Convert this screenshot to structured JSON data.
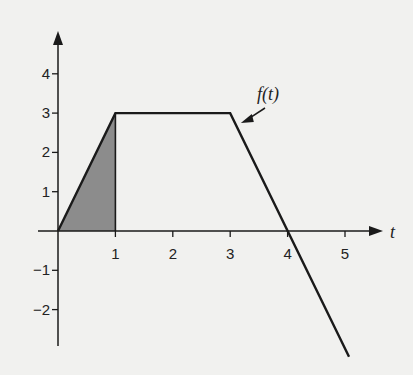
{
  "chart_data": {
    "type": "line",
    "title": "",
    "xlabel": "t",
    "ylabel": "",
    "series": [
      {
        "name": "f(t)",
        "x": [
          0,
          1,
          3,
          5.07
        ],
        "y": [
          0,
          3,
          3,
          -3.2
        ]
      }
    ],
    "shaded_region": {
      "from_t": 0,
      "to_t": 1,
      "description": "area under f(t) from t=0 to t=1",
      "color": "#8c8c8c"
    },
    "annotations": [
      {
        "text": "f(t)",
        "arrow_to": [
          3.15,
          2.7
        ]
      }
    ],
    "x_ticks": [
      1,
      2,
      3,
      4,
      5
    ],
    "x_tick_labels": [
      "1",
      "2",
      "3",
      "4",
      "5"
    ],
    "y_ticks": [
      -2,
      -1,
      1,
      2,
      3,
      4
    ],
    "y_tick_labels": [
      "−2",
      "−1",
      "1",
      "2",
      "3",
      "4"
    ],
    "xlim": [
      -0.35,
      5.6
    ],
    "ylim": [
      -3.2,
      4.9
    ],
    "grid": false,
    "legend": "none"
  },
  "labels": {
    "curve": "f(t)",
    "x_axis": "t"
  },
  "colors": {
    "line": "#1a1a1a",
    "shade": "#8c8c8c",
    "background": "#f1f1ef"
  }
}
